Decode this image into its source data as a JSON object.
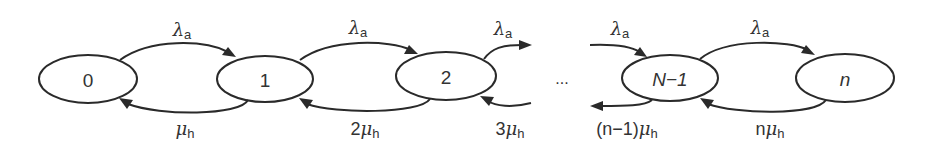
{
  "diagram": {
    "type": "birth-death state transition diagram",
    "nodes": [
      {
        "id": "s0",
        "label": "0",
        "italic": false
      },
      {
        "id": "s1",
        "label": "1",
        "italic": false
      },
      {
        "id": "s2",
        "label": "2",
        "italic": false
      },
      {
        "id": "sN1",
        "label": "N−1",
        "italic": true
      },
      {
        "id": "sn",
        "label": "n",
        "italic": true
      }
    ],
    "ellipsis": "...",
    "symbols": {
      "lambda": "λ",
      "mu": "μ",
      "arrival_sub": "a",
      "service_sub": "h"
    },
    "forward_edges": [
      {
        "from": "0",
        "to": "1",
        "coef": ""
      },
      {
        "from": "1",
        "to": "2",
        "coef": ""
      },
      {
        "from": "2",
        "to": "...",
        "coef": ""
      },
      {
        "from": "...",
        "to": "N−1",
        "coef": ""
      },
      {
        "from": "N−1",
        "to": "n",
        "coef": ""
      }
    ],
    "backward_edges": [
      {
        "from": "1",
        "to": "0",
        "coef": ""
      },
      {
        "from": "2",
        "to": "1",
        "coef": "2"
      },
      {
        "from": "...",
        "to": "2",
        "coef": "3"
      },
      {
        "from": "N−1",
        "to": "...",
        "coef": "(n−1)"
      },
      {
        "from": "n",
        "to": "N−1",
        "coef": "n"
      }
    ]
  }
}
